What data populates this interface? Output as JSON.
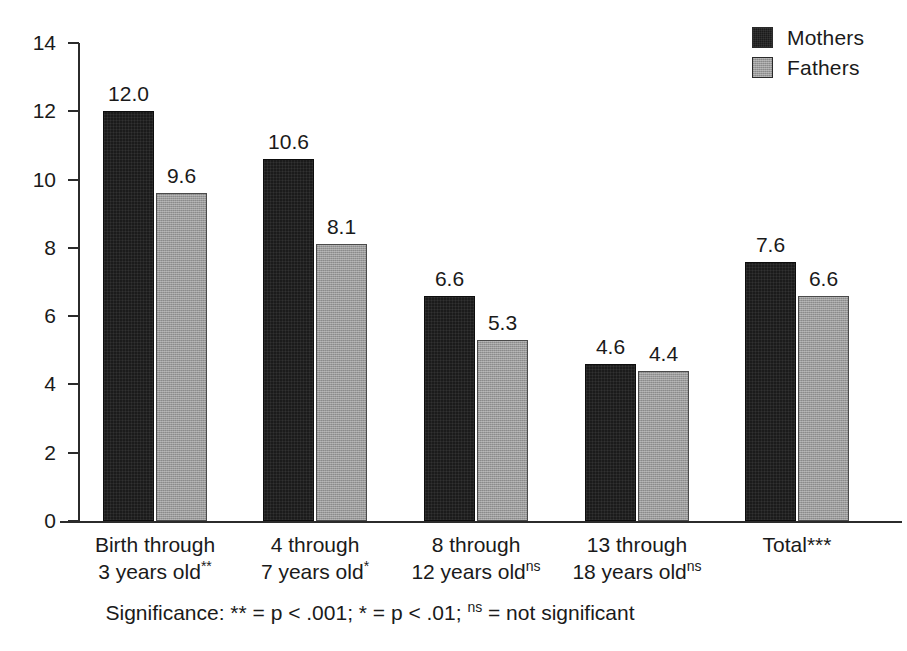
{
  "chart_data": {
    "type": "bar",
    "title": "",
    "subtitle": "",
    "xlabel": "",
    "ylabel": "",
    "ylim": [
      0,
      14
    ],
    "yticks": [
      0,
      2,
      4,
      6,
      8,
      10,
      12,
      14
    ],
    "ytick_labels": [
      "0",
      "2",
      "4",
      "6",
      "8",
      "10",
      "12",
      "14"
    ],
    "grid": false,
    "legend_position": "top-right",
    "categories": [
      "Birth through 3 years old**",
      "4 through 7 years old*",
      "8 through 12 years oldns",
      "13 through 18 years oldns",
      "Total***"
    ],
    "series": [
      {
        "name": "Mothers",
        "color": "#1b1b1b",
        "values": [
          12.0,
          10.6,
          6.6,
          4.6,
          7.6
        ]
      },
      {
        "name": "Fathers",
        "color": "#9b9b9b",
        "values": [
          9.6,
          8.1,
          5.3,
          4.4,
          6.6
        ]
      }
    ],
    "value_labels": [
      [
        "12.0",
        "9.6"
      ],
      [
        "10.6",
        "8.1"
      ],
      [
        "6.6",
        "5.3"
      ],
      [
        "4.6",
        "4.4"
      ],
      [
        "7.6",
        "6.6"
      ]
    ],
    "annotation": "Significance: ** = p < .001; * = p < .01; ns = not significant"
  },
  "legend": {
    "items": [
      {
        "label": "Mothers",
        "swatch": "dark"
      },
      {
        "label": "Fathers",
        "swatch": "gray"
      }
    ]
  },
  "axis": {
    "y_ticks": [
      "14",
      "12",
      "10",
      "8",
      "6",
      "4",
      "2",
      "0"
    ]
  },
  "categories": [
    {
      "line1": "Birth through",
      "line2": "3 years old",
      "sup": "**"
    },
    {
      "line1": "4 through",
      "line2": "7 years old",
      "sup": "*"
    },
    {
      "line1": "8 through",
      "line2": "12 years old",
      "sup": "ns"
    },
    {
      "line1": "13 through",
      "line2": "18 years old",
      "sup": "ns"
    },
    {
      "line1": "Total***",
      "line2": "",
      "sup": ""
    }
  ],
  "footnote": {
    "prefix": "Significance: ** = p < .001; * = p < .01; ",
    "sup": "ns",
    "suffix": " = not significant"
  }
}
